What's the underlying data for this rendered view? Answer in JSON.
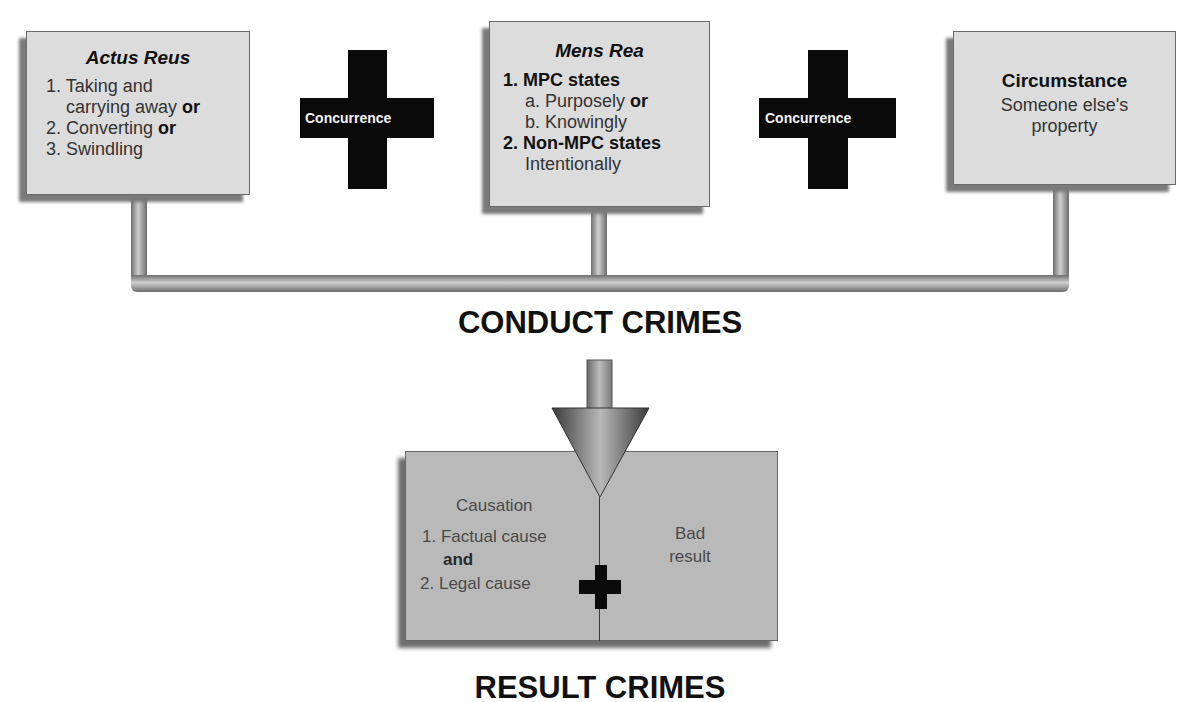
{
  "top_boxes": {
    "actus_reus": {
      "title": "Actus Reus",
      "items": [
        {
          "num": "1.",
          "text": "Taking and",
          "connector": ""
        },
        {
          "num": "",
          "text": "carrying away",
          "connector": "or"
        },
        {
          "num": "2.",
          "text": "Converting",
          "connector": "or"
        },
        {
          "num": "3.",
          "text": "Swindling",
          "connector": ""
        }
      ]
    },
    "mens_rea": {
      "title": "Mens Rea",
      "sections": [
        {
          "heading": "1. MPC states",
          "lines": [
            {
              "text": "a. Purposely",
              "connector": "or"
            },
            {
              "text": "b. Knowingly",
              "connector": ""
            }
          ]
        },
        {
          "heading": "2. Non-MPC states",
          "lines": [
            {
              "text": "Intentionally",
              "connector": ""
            }
          ]
        }
      ]
    },
    "circumstance": {
      "title": "Circumstance",
      "lines": [
        "Someone else's",
        "property"
      ]
    }
  },
  "connectors": {
    "concurrence_1": "Concurrence",
    "concurrence_2": "Concurrence"
  },
  "headings": {
    "conduct_crimes": "CONDUCT CRIMES",
    "result_crimes": "RESULT CRIMES"
  },
  "result_box": {
    "causation": {
      "title": "Causation",
      "items": [
        {
          "num": "1.",
          "text": "Factual cause"
        },
        {
          "num": "",
          "text": "and",
          "bold": true
        },
        {
          "num": "2.",
          "text": "Legal cause"
        }
      ]
    },
    "bad_result": [
      "Bad",
      "result"
    ]
  },
  "colors": {
    "box_fill": "#dcdcdc",
    "result_fill": "#b9b9b9",
    "cross": "#0a0a0a",
    "pipe": "#9a9a9a"
  }
}
